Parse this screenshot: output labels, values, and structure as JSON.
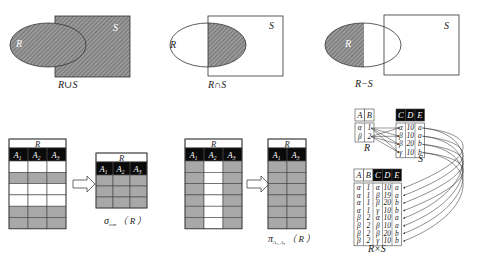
{
  "colors": {
    "hatch_fill": "#8c8c8c",
    "hatch_line": "#5a5a5a",
    "gray_row": "#a8a8a8",
    "header_black": "#0a0a0a",
    "stroke": "#333333"
  },
  "venn": [
    {
      "id": "union",
      "label": "R∪S",
      "set_r": "R",
      "set_s": "S"
    },
    {
      "id": "intersection",
      "label": "R∩S",
      "set_r": "R",
      "set_s": "S"
    },
    {
      "id": "difference",
      "label": "R−S",
      "set_r": "R",
      "set_s": "S"
    }
  ],
  "selection": {
    "input_title": "R",
    "output_title": "R",
    "columns": [
      "A",
      "A",
      "A"
    ],
    "column_subscripts": [
      "1",
      "2",
      "3"
    ],
    "input_row_pattern": [
      "white",
      "gray",
      "white",
      "white",
      "gray",
      "gray"
    ],
    "output_row_count": 3,
    "caption_symbol": "σ",
    "caption_subscript": "con",
    "caption_arg": "（ R ）"
  },
  "projection": {
    "input_title": "R",
    "output_title": "R",
    "columns": [
      "A",
      "A",
      "A"
    ],
    "column_subscripts": [
      "1",
      "2",
      "3"
    ],
    "output_columns": [
      "A",
      "A"
    ],
    "output_subscripts": [
      "1",
      "3"
    ],
    "row_count": 6,
    "caption_symbol": "π",
    "caption_subscript": "A₁, A₃",
    "caption_arg": "（ R ）"
  },
  "product": {
    "r_label": "R",
    "s_label": "S",
    "result_label": "R×S",
    "r_columns": [
      "A",
      "B"
    ],
    "r_rows": [
      [
        "α",
        "1"
      ],
      [
        "β",
        "2"
      ]
    ],
    "s_columns": [
      "C",
      "D",
      "E"
    ],
    "s_rows": [
      [
        "α",
        "10",
        "a"
      ],
      [
        "β",
        "10",
        "a"
      ],
      [
        "β",
        "20",
        "b"
      ],
      [
        "γ",
        "10",
        "b"
      ]
    ],
    "result_columns": [
      "A",
      "B",
      "C",
      "D",
      "E"
    ],
    "result_rows": [
      [
        "α",
        "1",
        "α",
        "10",
        "a"
      ],
      [
        "α",
        "1",
        "β",
        "19",
        "a"
      ],
      [
        "α",
        "1",
        "β",
        "20",
        "b"
      ],
      [
        "α",
        "1",
        "γ",
        "10",
        "b"
      ],
      [
        "β",
        "2",
        "α",
        "10",
        "a"
      ],
      [
        "β",
        "2",
        "β",
        "10",
        "a"
      ],
      [
        "β",
        "2",
        "β",
        "20",
        "b"
      ],
      [
        "β",
        "2",
        "γ",
        "10",
        "b"
      ]
    ]
  }
}
